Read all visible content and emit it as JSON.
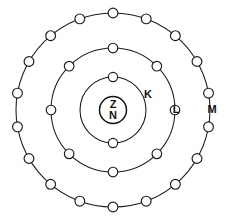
{
  "figure": {
    "type": "atomic-shell-diagram",
    "width": 228,
    "height": 216,
    "background_color": "#ffffff",
    "stroke_color": "#1b1b1b",
    "electron_fill_color": "#ffffff",
    "label_color": "#111111"
  },
  "nucleus": {
    "label_top": "Z",
    "label_bottom": "N",
    "center_x": 113,
    "center_y": 110,
    "radius": 13.5
  },
  "shells": [
    {
      "id": "K",
      "label": "K",
      "radius": 33,
      "electron_count": 2,
      "electron_radius": 4.6,
      "label_x": 148,
      "label_y": 95,
      "electron_angles": [
        0,
        180
      ]
    },
    {
      "id": "L",
      "label": "L",
      "radius": 62,
      "electron_count": 8,
      "electron_radius": 4.8,
      "label_x": 176,
      "label_y": 110,
      "electron_angles": [
        0,
        45,
        90,
        135,
        180,
        225,
        270,
        315
      ]
    },
    {
      "id": "M",
      "label": "M",
      "radius": 97,
      "electron_count": 18,
      "electron_radius": 4.9,
      "label_x": 212,
      "label_y": 110,
      "electron_angles": [
        0,
        20,
        40,
        60,
        80,
        100,
        120,
        140,
        160,
        180,
        200,
        220,
        240,
        260,
        280,
        300,
        320,
        340
      ]
    }
  ],
  "chart_data": {
    "type": "diagram",
    "categories": [
      "K",
      "L",
      "M"
    ],
    "values": [
      2,
      8,
      18
    ],
    "xlabel": "Electron shell",
    "ylabel": "Number of electrons",
    "annotations": [
      "Z",
      "N"
    ],
    "legend": [
      "K",
      "L",
      "M"
    ],
    "grid": false
  }
}
